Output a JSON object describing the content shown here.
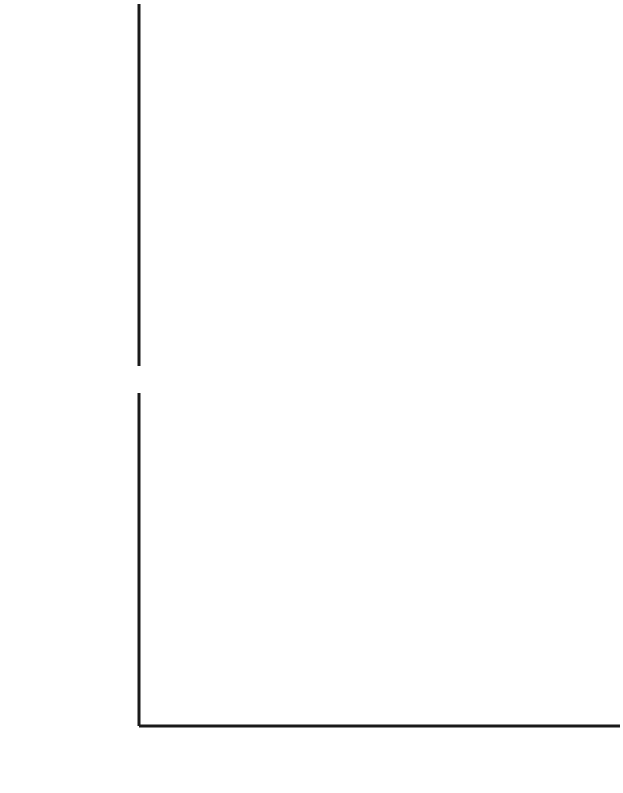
{
  "figure": {
    "caption_present": false
  },
  "chart_data": [
    {
      "type": "line",
      "id": "temperature-panel",
      "title": "",
      "xlabel": "",
      "ylabel": "Temperature (K)",
      "xlim": [
        50,
        168
      ],
      "ylim": [
        250,
        346
      ],
      "x_ticks": [],
      "y_ticks": [
        260,
        280,
        300,
        320,
        340
      ],
      "y_tick_labels": [
        "260",
        "280",
        "300",
        "320",
        "340"
      ],
      "y_minor_ticks": [
        270,
        290,
        310,
        330
      ],
      "grid": false,
      "legend": "annotations",
      "annotations": [
        {
          "text": "Barren planet",
          "line1": "Barren",
          "line2": "planet",
          "x": 103,
          "y": 329
        },
        {
          "text": "Daisy feedback",
          "line1": "Daisy",
          "line2": "feedback",
          "x": 139,
          "y": 285
        }
      ],
      "series": [
        {
          "name": "Daisy feedback",
          "style": "solid-gray",
          "color": "#8f8f8f",
          "points": [
            [
              50.0,
              252.6
            ],
            [
              55.0,
              257.0
            ],
            [
              59.0,
              261.2
            ],
            [
              62.0,
              265.8
            ],
            [
              62.3,
              288.0
            ],
            [
              63.5,
              290.5
            ],
            [
              66.0,
              293.0
            ],
            [
              70.0,
              296.4
            ],
            [
              74.0,
              298.8
            ],
            [
              76.0,
              299.2
            ],
            [
              80.0,
              298.6
            ],
            [
              90.0,
              296.6
            ],
            [
              100.0,
              295.4
            ],
            [
              110.0,
              294.6
            ],
            [
              120.0,
              293.8
            ],
            [
              130.0,
              293.2
            ],
            [
              136.0,
              293.0
            ],
            [
              142.0,
              294.6
            ],
            [
              148.0,
              297.4
            ],
            [
              153.0,
              300.0
            ],
            [
              155.8,
              302.2
            ],
            [
              156.2,
              336.2
            ],
            [
              160.0,
              339.4
            ],
            [
              165.0,
              343.2
            ],
            [
              168.0,
              345.6
            ]
          ]
        },
        {
          "name": "Barren planet",
          "style": "dotted-black",
          "color": "#141414",
          "points": [
            [
              55.0,
              257.0
            ],
            [
              62.0,
              265.0
            ],
            [
              80.0,
              283.5
            ],
            [
              100.0,
              300.0
            ],
            [
              120.0,
              314.5
            ],
            [
              140.0,
              327.0
            ],
            [
              156.0,
              336.0
            ],
            [
              168.0,
              345.5
            ]
          ]
        }
      ]
    },
    {
      "type": "line",
      "id": "area-panel",
      "title": "",
      "xlabel": "Luminosity (%)",
      "ylabel": "Area Covered (%)",
      "xlim": [
        50,
        168
      ],
      "ylim": [
        0,
        75
      ],
      "x_ticks": [
        60,
        80,
        100,
        120,
        140,
        160
      ],
      "x_tick_labels": [
        "60",
        "80",
        "100",
        "120",
        "140",
        "160"
      ],
      "x_minor_ticks": [
        70,
        90,
        110,
        130,
        150
      ],
      "y_ticks": [
        0,
        10,
        20,
        30,
        40,
        50,
        60,
        70
      ],
      "y_tick_labels": [
        "0",
        "10",
        "20",
        "30",
        "40",
        "50",
        "60",
        "70"
      ],
      "y_minor_ticks": [
        5,
        15,
        25,
        35,
        45,
        55,
        65
      ],
      "grid": false,
      "legend": "annotations",
      "annotations": [
        {
          "text": "Total",
          "x": 103,
          "y": 73
        },
        {
          "text": "White daisies",
          "x": 128,
          "y": 51
        },
        {
          "text": "Black daisies",
          "x": 126,
          "y": 19
        }
      ],
      "series": [
        {
          "name": "Total",
          "style": "solid-black-over-gray",
          "color": "#141414",
          "points": [
            [
              50.0,
              0.0
            ],
            [
              62.0,
              0.0
            ],
            [
              62.2,
              30.0
            ],
            [
              62.6,
              58.0
            ],
            [
              63.4,
              66.0
            ],
            [
              64.6,
              69.0
            ],
            [
              67.0,
              70.2
            ],
            [
              69.0,
              70.3
            ],
            [
              71.0,
              69.8
            ],
            [
              73.0,
              68.5
            ],
            [
              75.0,
              67.5
            ],
            [
              80.0,
              67.4
            ],
            [
              100.0,
              67.4
            ],
            [
              120.0,
              67.4
            ],
            [
              134.0,
              67.4
            ],
            [
              138.0,
              67.9
            ],
            [
              143.0,
              69.2
            ],
            [
              147.0,
              70.1
            ],
            [
              150.0,
              70.3
            ],
            [
              153.0,
              70.0
            ],
            [
              155.0,
              69.0
            ],
            [
              156.4,
              66.0
            ],
            [
              156.8,
              30.0
            ],
            [
              157.0,
              0.0
            ],
            [
              168.0,
              0.0
            ]
          ]
        },
        {
          "name": "Black daisies",
          "style": "dashed-gray",
          "color": "#8f8f8f",
          "points": [
            [
              62.4,
              52.0
            ],
            [
              64.0,
              64.0
            ],
            [
              66.0,
              68.0
            ],
            [
              69.0,
              70.0
            ],
            [
              72.0,
              69.0
            ],
            [
              75.0,
              66.0
            ],
            [
              80.0,
              60.0
            ],
            [
              85.0,
              53.5
            ],
            [
              90.0,
              46.5
            ],
            [
              95.0,
              39.0
            ],
            [
              100.0,
              32.5
            ],
            [
              105.0,
              26.5
            ],
            [
              110.0,
              21.0
            ],
            [
              115.0,
              16.0
            ],
            [
              120.0,
              11.5
            ],
            [
              125.0,
              7.5
            ],
            [
              130.0,
              3.8
            ],
            [
              134.0,
              1.3
            ],
            [
              136.5,
              0.0
            ]
          ]
        },
        {
          "name": "White daisies",
          "style": "dashed-gray",
          "color": "#8f8f8f",
          "points": [
            [
              74.0,
              0.0
            ],
            [
              77.0,
              2.0
            ],
            [
              80.0,
              5.0
            ],
            [
              85.0,
              11.0
            ],
            [
              90.0,
              17.5
            ],
            [
              95.0,
              24.5
            ],
            [
              100.0,
              31.0
            ],
            [
              105.0,
              37.5
            ],
            [
              110.0,
              43.5
            ],
            [
              115.0,
              49.0
            ],
            [
              120.0,
              54.5
            ],
            [
              125.0,
              59.0
            ],
            [
              130.0,
              63.0
            ],
            [
              135.0,
              66.0
            ],
            [
              140.0,
              68.0
            ],
            [
              145.0,
              69.4
            ],
            [
              149.0,
              70.0
            ],
            [
              152.0,
              69.6
            ],
            [
              155.0,
              68.0
            ],
            [
              156.4,
              64.0
            ]
          ]
        }
      ]
    }
  ]
}
